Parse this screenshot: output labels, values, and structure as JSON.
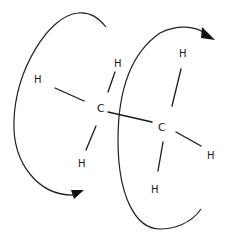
{
  "diagram": {
    "colors": {
      "line": "#1a1a1a",
      "background": "#ffffff"
    },
    "atoms": {
      "c_left": {
        "label": "C"
      },
      "c_right": {
        "label": "C"
      },
      "h_left_upper": {
        "label": "H"
      },
      "h_left_top": {
        "label": "H"
      },
      "h_left_bottom": {
        "label": "H"
      },
      "h_right_top": {
        "label": "H"
      },
      "h_right_side": {
        "label": "H"
      },
      "h_right_bottom": {
        "label": "H"
      }
    },
    "arrows": {
      "left": {
        "direction": "rotation-arrow-front-carbon"
      },
      "right": {
        "direction": "rotation-arrow-back-carbon"
      }
    }
  }
}
